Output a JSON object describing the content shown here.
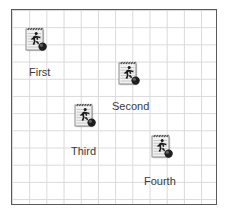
{
  "canvas": {
    "background_color": "#ffffff",
    "border_color": "#5a5a5a",
    "grid_color": "#d9d9d9",
    "grid_cell_px": 17,
    "grid_columns": 12,
    "grid_rows": 11
  },
  "markers": [
    {
      "label": "First",
      "icon": "runner-notepad-icon",
      "icon_x": 23,
      "icon_y": 25,
      "label_x": 28,
      "label_y": 65
    },
    {
      "label": "Second",
      "icon": "runner-notepad-icon",
      "icon_x": 116,
      "icon_y": 59,
      "label_x": 111,
      "label_y": 99
    },
    {
      "label": "Third",
      "icon": "runner-notepad-icon",
      "icon_x": 72,
      "icon_y": 101,
      "label_x": 70,
      "label_y": 144
    },
    {
      "label": "Fourth",
      "icon": "runner-notepad-icon",
      "icon_x": 149,
      "icon_y": 132,
      "label_x": 143,
      "label_y": 174
    }
  ],
  "icon_colors": {
    "paper": "#f2f2f2",
    "paper_edge": "#8c8c8c",
    "rule_line": "#b8b8b8",
    "spiral": "#4a4a4a",
    "figure": "#1a1a1a",
    "ball_dark": "#1f1f1f",
    "ball_light": "#7d7d7d",
    "shadow": "#9a9a9a"
  }
}
